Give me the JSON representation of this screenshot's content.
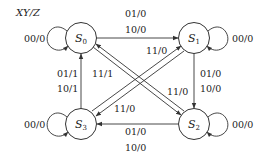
{
  "diagram": {
    "title": "XY/Z",
    "states": [
      {
        "id": "S0",
        "base": "S",
        "sub": "0"
      },
      {
        "id": "S1",
        "base": "S",
        "sub": "1"
      },
      {
        "id": "S2",
        "base": "S",
        "sub": "2"
      },
      {
        "id": "S3",
        "base": "S",
        "sub": "3"
      }
    ],
    "transitions": {
      "s0_self": "00/0",
      "s1_self": "00/0",
      "s2_self": "00/0",
      "s3_self": "00/0",
      "s0_to_s1_a": "01/0",
      "s0_to_s1_b": "10/0",
      "s1_to_s2_a": "01/0",
      "s1_to_s2_b": "10/0",
      "s2_to_s3_a": "01/0",
      "s2_to_s3_b": "10/0",
      "s3_to_s0_a": "01/1",
      "s3_to_s0_b": "10/1",
      "s3_to_s1": "11/0",
      "s0_to_s2": "11/0",
      "s1_to_s3": "11/0",
      "s2_to_s0": "11/1"
    },
    "colors": {
      "line": "#333333",
      "text": "#222222",
      "background": "#ffffff"
    }
  }
}
